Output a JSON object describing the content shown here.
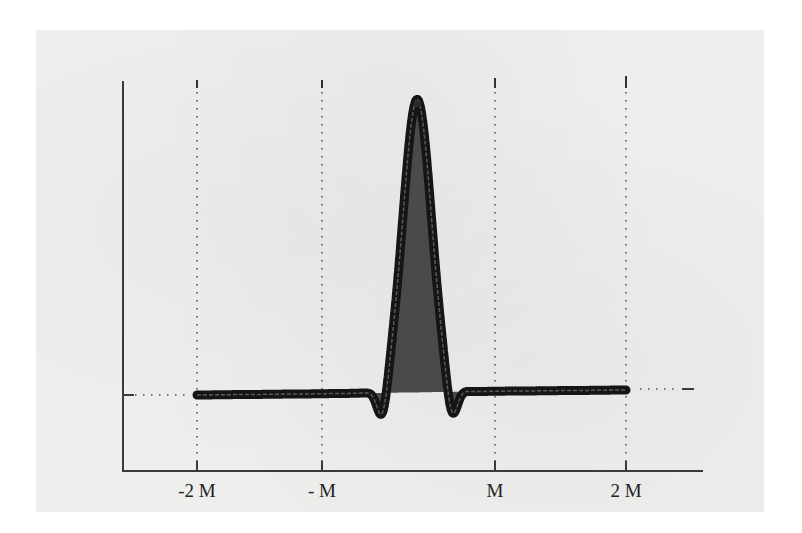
{
  "chart_data": {
    "type": "line",
    "title": "",
    "xlabel": "",
    "ylabel": "",
    "x_ticks": [
      {
        "label": "-2 M",
        "value": -2
      },
      {
        "label": "- M",
        "value": -1
      },
      {
        "label": "M",
        "value": 1
      },
      {
        "label": "2 M",
        "value": 2
      }
    ],
    "xlim": [
      -2.6,
      2.35
    ],
    "ylim": [
      -0.12,
      1.0
    ],
    "grid": "vertical dotted lines at ticks, horizontal dotted baseline reference",
    "legend": "none",
    "series": [
      {
        "name": "filled oscillating curve",
        "description": "flat baseline from -2M to 2M with a single tall central peak (filled dark) near x=0.1M flanked by two small negative troughs; peak edge shows fine ripples",
        "baseline": 0.0,
        "peak": {
          "x": 0.1,
          "y": 1.0
        },
        "troughs": [
          {
            "x": -0.3,
            "y": -0.1
          },
          {
            "x": 0.5,
            "y": -0.1
          }
        ],
        "x_range": [
          -2,
          2
        ]
      }
    ],
    "colors": {
      "curve_fill": "#4a4a4a",
      "curve_stroke": "#151515",
      "axis": "#3a3a3a",
      "paper": "#eeeeec"
    }
  }
}
